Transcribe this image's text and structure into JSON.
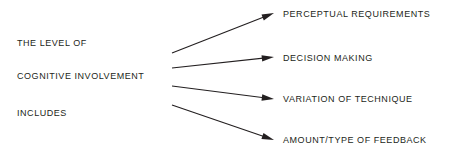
{
  "diagram": {
    "type": "fan-out-relationship",
    "title_text": "THE LEVEL OF COGNITIVE INVOLVEMENT INCLUDES",
    "background_color": "#ffffff",
    "text_color": "#231f20",
    "arrow_color": "#231f20",
    "source": {
      "lines": [
        {
          "text": "THE LEVEL OF",
          "x": 17,
          "y": 43
        },
        {
          "text": "COGNITIVE INVOLVEMENT",
          "x": 17,
          "y": 76
        },
        {
          "text": "INCLUDES",
          "x": 17,
          "y": 113
        }
      ]
    },
    "targets": [
      {
        "text": "PERCEPTUAL REQUIREMENTS",
        "x": 283,
        "y": 14
      },
      {
        "text": "DECISION MAKING",
        "x": 283,
        "y": 58
      },
      {
        "text": "VARIATION OF TECHNIQUE",
        "x": 283,
        "y": 99
      },
      {
        "text": "AMOUNT/TYPE OF FEEDBACK",
        "x": 283,
        "y": 140
      }
    ],
    "arrows": [
      {
        "name": "arrow-to-perceptual-requirements",
        "x1": 172,
        "y1": 53,
        "x2": 274,
        "y2": 13
      },
      {
        "name": "arrow-to-decision-making",
        "x1": 172,
        "y1": 68,
        "x2": 274,
        "y2": 57
      },
      {
        "name": "arrow-to-variation-of-technique",
        "x1": 172,
        "y1": 86,
        "x2": 274,
        "y2": 99
      },
      {
        "name": "arrow-to-amount-type-of-feedback",
        "x1": 172,
        "y1": 105,
        "x2": 274,
        "y2": 140
      }
    ]
  }
}
